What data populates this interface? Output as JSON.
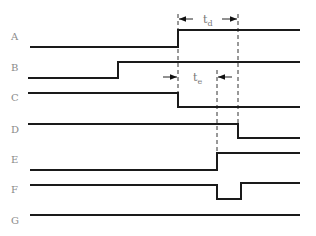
{
  "diagram": {
    "type": "timing-diagram",
    "signals": [
      {
        "label": "A",
        "label_y": 40,
        "path": "M30,47 L178,47 L178,30 L300,30"
      },
      {
        "label": "B",
        "label_y": 71,
        "path": "M28,78 L118,78 L118,62 L300,62"
      },
      {
        "label": "C",
        "label_y": 101,
        "path": "M28,93 L178,93 L178,107 L300,107"
      },
      {
        "label": "D",
        "label_y": 133,
        "path": "M28,124 L238,124 L238,138 L300,138"
      },
      {
        "label": "E",
        "label_y": 163,
        "path": "M30,170 L217,170 L217,153 L300,153"
      },
      {
        "label": "F",
        "label_y": 193,
        "path": "M30,185 L217,185 L217,199 L241,199 L241,183 L300,183"
      },
      {
        "label": "G",
        "label_y": 224,
        "path": "M30,215 L300,215"
      }
    ],
    "markers": [
      {
        "name": "td",
        "text": "t",
        "sub": "d",
        "x1": 178,
        "x2": 238,
        "y": 19
      },
      {
        "name": "te",
        "text": "t",
        "sub": "e",
        "x1": 178,
        "x2": 217,
        "y": 77
      }
    ],
    "dashed_lines": [
      {
        "x": 178,
        "y1": 14,
        "y2": 108
      },
      {
        "x": 238,
        "y1": 14,
        "y2": 124
      },
      {
        "x": 217,
        "y1": 70,
        "y2": 153
      }
    ]
  }
}
